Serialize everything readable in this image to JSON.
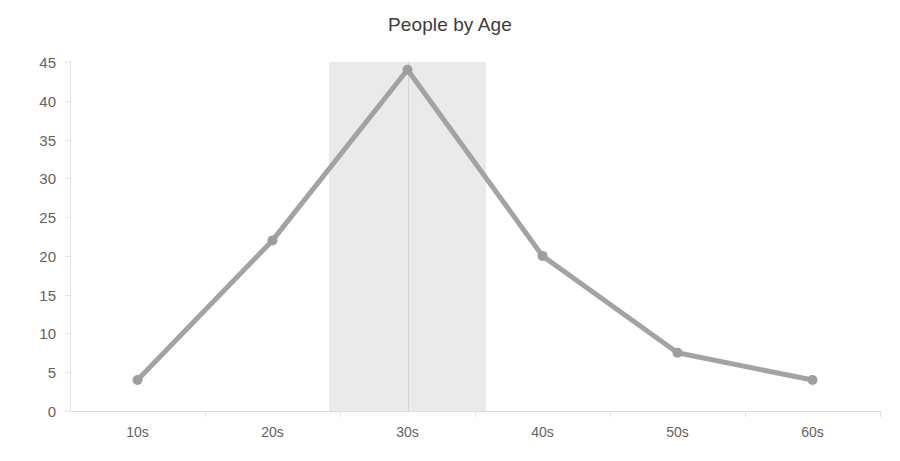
{
  "chart_data": {
    "type": "line",
    "title": "People by Age",
    "xlabel": "",
    "ylabel": "",
    "categories": [
      "10s",
      "20s",
      "30s",
      "40s",
      "50s",
      "60s"
    ],
    "series": [
      {
        "name": "People",
        "values": [
          4,
          22,
          44,
          20,
          7.5,
          4
        ],
        "color": "#a3a3a3",
        "marker_color": "#9e9e9e"
      }
    ],
    "ylim": [
      0,
      45
    ],
    "y_ticks": [
      0,
      5,
      10,
      15,
      20,
      25,
      30,
      35,
      40,
      45
    ],
    "y_tick_labels": [
      "0",
      "5",
      "10",
      "15",
      "20",
      "25",
      "30",
      "35",
      "40",
      "45"
    ],
    "grid": false,
    "legend": "none",
    "annotations": [
      {
        "name": "highlight-band",
        "type": "vertical-span",
        "from": "25s",
        "to": "35s",
        "center": "30s",
        "color": "#e6e6e6"
      },
      {
        "name": "center-reference-line",
        "type": "vertical-line",
        "at": "30s",
        "color": "#d2d2d2"
      }
    ]
  },
  "axes": {
    "y_axis_color": "#e2e2e2",
    "x_axis_color": "#dcdcdc",
    "tick_label_color": "#636363"
  },
  "style": {
    "background": "#ffffff",
    "title_color": "#3d3d3d"
  }
}
